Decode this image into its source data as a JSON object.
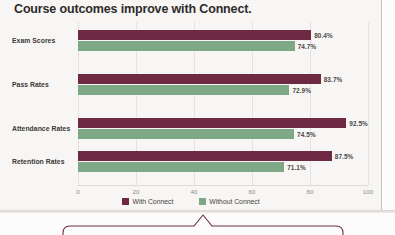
{
  "chart_data": {
    "type": "bar",
    "orientation": "horizontal",
    "title": "Course outcomes improve with Connect.",
    "xlabel": "",
    "ylabel": "",
    "xlim": [
      0,
      100
    ],
    "xticks": [
      "0",
      "20",
      "40",
      "60",
      "80",
      "100"
    ],
    "grid": true,
    "legend_position": "bottom-center",
    "categories": [
      "Exam Scores",
      "Pass Rates",
      "Attendance Rates",
      "Retention Rates"
    ],
    "series": [
      {
        "name": "With Connect",
        "color": "#6e2a42",
        "values": [
          80.4,
          83.7,
          92.5,
          87.5
        ],
        "labels": [
          "80.4%",
          "83.7%",
          "92.5%",
          "87.5%"
        ]
      },
      {
        "name": "Without Connect",
        "color": "#7fa886",
        "values": [
          74.7,
          72.9,
          74.5,
          71.1
        ],
        "labels": [
          "74.7%",
          "72.9%",
          "74.5%",
          "71.1%"
        ]
      }
    ]
  },
  "legend": {
    "items": [
      {
        "label": "With Connect",
        "color": "#6e2a42"
      },
      {
        "label": "Without Connect",
        "color": "#7fa886"
      }
    ]
  },
  "callout": {
    "border_color": "#6e2a42",
    "shape": "rounded-box-with-top-pointer"
  },
  "colors": {
    "with_connect": "#6e2a42",
    "without_connect": "#7fa886",
    "background": "#f8f6f5",
    "title_text": "#2d2b2a"
  }
}
